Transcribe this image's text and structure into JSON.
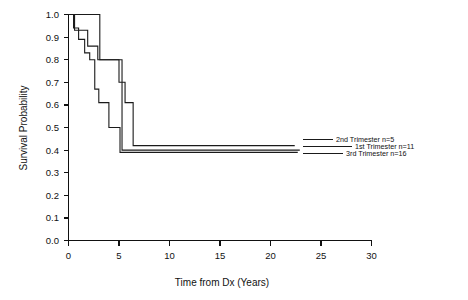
{
  "chart_data": {
    "type": "line",
    "title": "",
    "xlabel": "Time from Dx  (Years)",
    "ylabel": "Survival Probability",
    "xlim": [
      0,
      30
    ],
    "ylim": [
      0.0,
      1.0
    ],
    "xticks": [
      "0",
      "5",
      "10",
      "15",
      "20",
      "25",
      "30"
    ],
    "yticks": [
      "0.0",
      "0.1",
      "0.2",
      "0.3",
      "0.4",
      "0.5",
      "0.6",
      "0.7",
      "0.8",
      "0.9",
      "1.0"
    ],
    "grid": false,
    "legend_position": "right-inside",
    "step_type": "post",
    "series": [
      {
        "name": "1st Trimester",
        "label": "1st Trimester  n=11",
        "n": 11,
        "color": "#1a1a1a",
        "x": [
          0.0,
          0.6,
          1.1,
          1.9,
          2.3,
          2.9,
          3.5,
          4.3,
          5.0,
          5.6,
          6.4,
          22.4
        ],
        "y": [
          1.0,
          0.93,
          0.93,
          0.86,
          0.86,
          0.8,
          0.8,
          0.8,
          0.7,
          0.61,
          0.42,
          0.42
        ]
      },
      {
        "name": "2nd Trimester",
        "label": "2nd Trimester  n=5",
        "n": 5,
        "color": "#1a1a1a",
        "x": [
          0.0,
          2.6,
          3.1,
          4.2,
          4.7,
          5.3,
          22.9
        ],
        "y": [
          1.0,
          1.0,
          0.8,
          0.8,
          0.8,
          0.4,
          0.4
        ]
      },
      {
        "name": "3rd Trimester",
        "label": "3rd Trimester  n=16",
        "n": 16,
        "color": "#1a1a1a",
        "x": [
          0.0,
          0.5,
          1.0,
          1.6,
          2.1,
          2.6,
          3.0,
          3.6,
          4.0,
          4.6,
          5.1,
          22.7
        ],
        "y": [
          1.0,
          0.94,
          0.89,
          0.83,
          0.8,
          0.67,
          0.61,
          0.61,
          0.5,
          0.5,
          0.39,
          0.39
        ]
      }
    ],
    "legend_entries": [
      {
        "label": "2nd Trimester  n=5"
      },
      {
        "label": "1st Trimester  n=11"
      },
      {
        "label": "3rd Trimester  n=16"
      }
    ]
  }
}
